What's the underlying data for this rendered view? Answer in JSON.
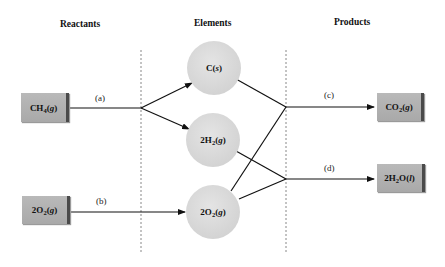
{
  "columns": {
    "reactants": "Reactants",
    "elements": "Elements",
    "products": "Products"
  },
  "reactants": [
    {
      "id": "ch4",
      "formula": "CH",
      "sub": "4",
      "state": "g",
      "coef": ""
    },
    {
      "id": "o2",
      "formula": "O",
      "sub": "2",
      "state": "g",
      "coef": "2"
    }
  ],
  "elements": [
    {
      "id": "c",
      "formula": "C",
      "sub": "",
      "state": "s",
      "coef": ""
    },
    {
      "id": "h2",
      "formula": "H",
      "sub": "2",
      "state": "g",
      "coef": "2"
    },
    {
      "id": "o2",
      "formula": "O",
      "sub": "2",
      "state": "g",
      "coef": "2"
    }
  ],
  "products": [
    {
      "id": "co2",
      "formula": "CO",
      "sub": "2",
      "state": "g",
      "coef": ""
    },
    {
      "id": "h2o",
      "formula": "H",
      "sub": "2",
      "tail": "O",
      "state": "l",
      "coef": "2"
    }
  ],
  "steps": {
    "a": "(a)",
    "b": "(b)",
    "c": "(c)",
    "d": "(d)"
  },
  "colors": {
    "box": "#b0b0b0",
    "box_edge": "#4a4a4a",
    "circle": "#d8d8d8",
    "line": "#111111",
    "divider": "#888888"
  }
}
